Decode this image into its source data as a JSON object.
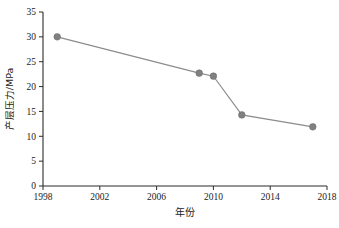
{
  "chart_data": {
    "type": "line",
    "title": "",
    "subtitle": "",
    "xlabel": "年份",
    "ylabel": "产层压力/MPa",
    "xlim": [
      1998,
      2018
    ],
    "ylim": [
      0,
      35
    ],
    "xticks": [
      1998,
      2002,
      2006,
      2010,
      2014,
      2018
    ],
    "yticks": [
      0,
      5,
      10,
      15,
      20,
      25,
      30,
      35
    ],
    "xtick_labels": [
      "1998",
      "2002",
      "2006",
      "2010",
      "2014",
      "2018"
    ],
    "ytick_labels": [
      "0",
      "5",
      "10",
      "15",
      "20",
      "25",
      "30",
      "35"
    ],
    "grid": false,
    "legend": null,
    "legend_position": "none",
    "frame": "left-bottom-only",
    "marker": "circle",
    "marker_color": "#808080",
    "line_color": "#8c8c8c",
    "axis_color": "#2b2b2b",
    "background": "#ffffff",
    "x": [
      1999,
      2009,
      2010,
      2012,
      2017
    ],
    "values": [
      30.0,
      22.7,
      22.1,
      14.3,
      11.9
    ],
    "series": [
      {
        "name": "产层压力",
        "points": [
          {
            "x": 1999,
            "y": 30.0
          },
          {
            "x": 2009,
            "y": 22.7
          },
          {
            "x": 2010,
            "y": 22.1
          },
          {
            "x": 2012,
            "y": 14.3
          },
          {
            "x": 2017,
            "y": 11.9
          }
        ]
      }
    ],
    "annotations": []
  }
}
